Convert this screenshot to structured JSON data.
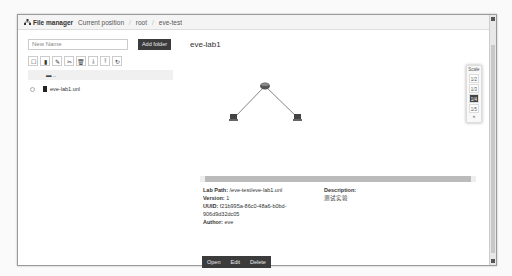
{
  "header": {
    "title": "File manager",
    "breadcrumb_label": "Current position",
    "breadcrumb": [
      "root",
      "eve-test"
    ]
  },
  "sidebar": {
    "new_name_placeholder": "New Name",
    "add_folder_label": "Add folder",
    "toolbar_icons": [
      "select-all-icon",
      "file-icon",
      "edit-icon",
      "cut-icon",
      "delete-icon",
      "download-icon",
      "upload-icon",
      "refresh-icon"
    ],
    "parent_folder_label": "..",
    "files": [
      {
        "name": "eve-lab1.unl"
      }
    ]
  },
  "lab": {
    "title": "eve-lab1",
    "path_label": "Lab Path:",
    "path": "/eve-test/eve-lab1.unl",
    "version_label": "Version:",
    "version": "1",
    "uuid_label": "UUID:",
    "uuid_line1": "f21b995a-86c0-48a6-b0bd-",
    "uuid_line2": "906d9d32dc05",
    "author_label": "Author:",
    "author": "eve",
    "description_label": "Description:",
    "description": "测试实验"
  },
  "scale": {
    "label": "Scale",
    "options": [
      "1/2",
      "1/3",
      "1/4",
      "1/5"
    ],
    "active": "1/4",
    "more": "«"
  },
  "actions": {
    "open": "Open",
    "edit": "Edit",
    "delete": "Delete"
  },
  "topology": {
    "nodes": [
      {
        "name": "router",
        "x": 75,
        "y": 34
      },
      {
        "name": "pc-left",
        "x": 44,
        "y": 66
      },
      {
        "name": "pc-right",
        "x": 108,
        "y": 66
      }
    ]
  }
}
